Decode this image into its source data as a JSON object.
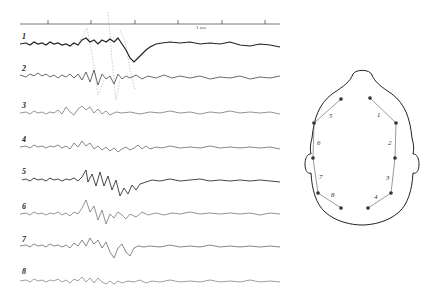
{
  "figure": {
    "time_marker": {
      "label": "1 sec",
      "tick_count": 6
    },
    "traces": [
      {
        "label": "1",
        "channel": 1
      },
      {
        "label": "2",
        "channel": 2
      },
      {
        "label": "3",
        "channel": 3
      },
      {
        "label": "4",
        "channel": 4
      },
      {
        "label": "5",
        "channel": 5
      },
      {
        "label": "6",
        "channel": 6
      },
      {
        "label": "7",
        "channel": 7
      },
      {
        "label": "8",
        "channel": 8
      }
    ],
    "head_diagram": {
      "view": "top-down scalp, nose up",
      "electrode_pairs": [
        {
          "label": "1",
          "side": "right",
          "region": "frontal"
        },
        {
          "label": "2",
          "side": "right",
          "region": "temporal-anterior"
        },
        {
          "label": "3",
          "side": "right",
          "region": "temporal-posterior"
        },
        {
          "label": "4",
          "side": "right",
          "region": "occipital"
        },
        {
          "label": "5",
          "side": "left",
          "region": "frontal"
        },
        {
          "label": "6",
          "side": "left",
          "region": "temporal-anterior"
        },
        {
          "label": "7",
          "side": "left",
          "region": "temporal-posterior"
        },
        {
          "label": "8",
          "side": "left",
          "region": "occipital"
        }
      ]
    },
    "colors": {
      "ink": "#222222",
      "faint_ink": "#9a9a9a",
      "background": "#ffffff"
    }
  }
}
